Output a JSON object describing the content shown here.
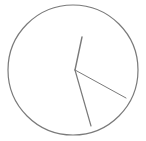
{
  "clock": {
    "label": "Analog clock face",
    "background_color": "#ffffff",
    "stroke_color": "#7a7a7a",
    "face": {
      "cx": 73,
      "cy": 70,
      "r": 65,
      "stroke_width": 1.2
    },
    "center": {
      "x": 75,
      "y": 70
    },
    "hands": [
      {
        "name": "hour-hand",
        "x2": 82,
        "y2": 37,
        "stroke_width": 1.4
      },
      {
        "name": "minute-hand",
        "x2": 91,
        "y2": 126,
        "stroke_width": 1.2
      },
      {
        "name": "second-hand",
        "x2": 126,
        "y2": 98,
        "stroke_width": 1.0
      }
    ]
  }
}
